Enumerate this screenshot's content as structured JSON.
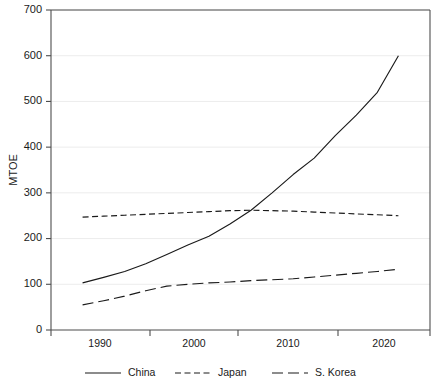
{
  "chart_data": {
    "type": "line",
    "title": "",
    "subtitle": "",
    "xlabel": "",
    "ylabel": "MTOE",
    "xlim": [
      1987,
      2023
    ],
    "ylim": [
      0,
      700
    ],
    "grid": true,
    "legend_position": "bottom",
    "x": [
      1990,
      1992,
      1994,
      1996,
      1998,
      2000,
      2002,
      2004,
      2006,
      2008,
      2010,
      2012,
      2014,
      2016,
      2018,
      2020
    ],
    "xtick_labels": [
      "1990",
      "2000",
      "2010",
      "2020"
    ],
    "xticks": [
      1990,
      2000,
      2010,
      2020
    ],
    "ytick_labels": [
      "0",
      "100",
      "200",
      "300",
      "400",
      "500",
      "600",
      "700"
    ],
    "yticks": [
      0,
      100,
      200,
      300,
      400,
      500,
      600,
      700
    ],
    "series": [
      {
        "name": "China",
        "style": "solid",
        "values": [
          103,
          115,
          128,
          145,
          165,
          186,
          205,
          232,
          262,
          300,
          340,
          376,
          425,
          470,
          520,
          600
        ]
      },
      {
        "name": "Japan",
        "style": "dashed",
        "values": [
          247,
          249,
          251,
          253,
          255,
          257,
          259,
          261,
          262,
          261,
          260,
          258,
          256,
          254,
          252,
          250
        ]
      },
      {
        "name": "S. Korea",
        "style": "long-dashed",
        "values": [
          55,
          64,
          74,
          86,
          96,
          100,
          103,
          105,
          108,
          110,
          112,
          116,
          120,
          124,
          128,
          133
        ]
      }
    ]
  },
  "legend": {
    "items": [
      {
        "label": "China",
        "style": "solid"
      },
      {
        "label": "Japan",
        "style": "dashed"
      },
      {
        "label": "S. Korea",
        "style": "long-dashed"
      }
    ]
  },
  "colors": {
    "line": "#1a1a1a",
    "axis": "#4d4d4d",
    "grid": "#ececec",
    "background": "#ffffff"
  }
}
